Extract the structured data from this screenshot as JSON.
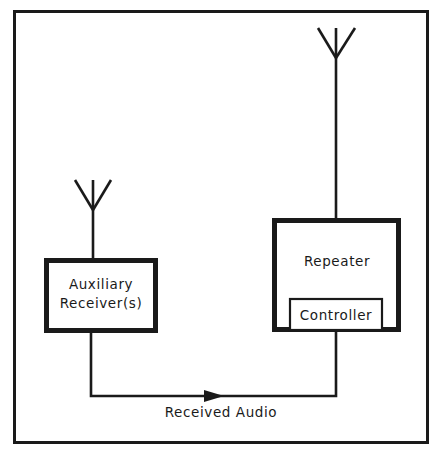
{
  "diagram": {
    "frame": {
      "name": "outer-border"
    },
    "colors": {
      "stroke": "#1a1a1a",
      "fill": "#ffffff",
      "background": "#ffffff"
    },
    "blocks": [
      {
        "id": "auxiliary-receivers",
        "label_line1": "Auxiliary",
        "label_line2": "Receiver(s)",
        "x": 44,
        "y": 258,
        "width": 114,
        "height": 75
      },
      {
        "id": "repeater",
        "label": "Repeater",
        "x": 272,
        "y": 218,
        "width": 129,
        "height": 114
      },
      {
        "id": "controller",
        "label": "Controller",
        "x": 289,
        "y": 298,
        "width": 94,
        "height": 34
      }
    ],
    "antennas": [
      {
        "id": "auxiliary-antenna",
        "mast_x": 93,
        "mast_top": 180,
        "mast_bottom": 258,
        "v_top_y": 180,
        "v_join_y": 210,
        "v_left_x": 75,
        "v_right_x": 111
      },
      {
        "id": "repeater-antenna",
        "mast_x": 336,
        "mast_top": 28,
        "mast_bottom": 218,
        "v_top_y": 28,
        "v_join_y": 58,
        "v_left_x": 318,
        "v_right_x": 355
      }
    ],
    "connections": [
      {
        "id": "received-audio-path",
        "label": "Received Audio",
        "label_x": 221,
        "label_y": 413,
        "from": "auxiliary-receivers",
        "to": "controller",
        "path": "M 91 333 L 91 396 L 336 396 L 336 332",
        "arrow_points": "204,390 224,396 204,402"
      }
    ]
  }
}
